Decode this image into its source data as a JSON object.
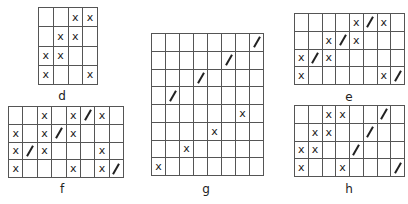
{
  "legend": {
    "x_symbol": "x",
    "slash_symbol": "/"
  },
  "grids": [
    {
      "label": "d",
      "left": 38,
      "top": 7,
      "width": 60,
      "height": 78,
      "cols": 4,
      "rows": 4,
      "cells": [
        [
          "",
          "",
          "x",
          "x"
        ],
        [
          "",
          "x",
          "x",
          ""
        ],
        [
          "x",
          "x",
          "",
          ""
        ],
        [
          "x",
          "",
          "",
          "x"
        ]
      ],
      "label_x": 62,
      "label_y": 89
    },
    {
      "label": "e",
      "left": 294,
      "top": 13,
      "width": 111,
      "height": 72,
      "cols": 8,
      "rows": 4,
      "cells": [
        [
          "",
          "",
          "",
          "",
          "x",
          "/",
          "x",
          ""
        ],
        [
          "",
          "",
          "x",
          "/",
          "x",
          "",
          "",
          ""
        ],
        [
          "x",
          "/",
          "x",
          "",
          "",
          "",
          "",
          ""
        ],
        [
          "x",
          "",
          "",
          "",
          "",
          "",
          "x",
          "/"
        ]
      ],
      "label_x": 349,
      "label_y": 90
    },
    {
      "label": "f",
      "left": 8,
      "top": 106,
      "width": 116,
      "height": 72,
      "cols": 8,
      "rows": 4,
      "cells": [
        [
          "",
          "",
          "x",
          "",
          "x",
          "/",
          "x",
          ""
        ],
        [
          "x",
          "",
          "x",
          "/",
          "x",
          "",
          "",
          ""
        ],
        [
          "x",
          "/",
          "x",
          "",
          "",
          "",
          "x",
          ""
        ],
        [
          "x",
          "",
          "",
          "",
          "x",
          "",
          "x",
          "/"
        ]
      ],
      "label_x": 62,
      "label_y": 182
    },
    {
      "label": "g",
      "left": 151,
      "top": 33,
      "width": 113,
      "height": 143,
      "cols": 8,
      "rows": 8,
      "cells": [
        [
          "",
          "",
          "",
          "",
          "",
          "",
          "",
          "/"
        ],
        [
          "",
          "",
          "",
          "",
          "",
          "/",
          "",
          ""
        ],
        [
          "",
          "",
          "",
          "/",
          "",
          "",
          "",
          ""
        ],
        [
          "",
          "/",
          "",
          "",
          "",
          "",
          "",
          ""
        ],
        [
          "",
          "",
          "",
          "",
          "",
          "",
          "x",
          ""
        ],
        [
          "",
          "",
          "",
          "",
          "x",
          "",
          "",
          ""
        ],
        [
          "",
          "",
          "x",
          "",
          "",
          "",
          "",
          ""
        ],
        [
          "x",
          "",
          "",
          "",
          "",
          "",
          "",
          ""
        ]
      ],
      "label_x": 206,
      "label_y": 182
    },
    {
      "label": "h",
      "left": 294,
      "top": 105,
      "width": 111,
      "height": 72,
      "cols": 8,
      "rows": 4,
      "cells": [
        [
          "",
          "",
          "x",
          "x",
          "",
          "",
          "/",
          ""
        ],
        [
          "",
          "x",
          "x",
          "",
          "",
          "/",
          "",
          ""
        ],
        [
          "x",
          "x",
          "",
          "",
          "/",
          "",
          "",
          ""
        ],
        [
          "x",
          "",
          "",
          "x",
          "",
          "",
          "",
          "/"
        ]
      ],
      "label_x": 349,
      "label_y": 182
    }
  ]
}
